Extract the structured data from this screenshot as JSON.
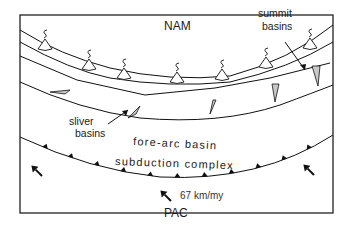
{
  "diagram": {
    "labels": {
      "upper_plate": "NAM",
      "summit_basins_line1": "summit",
      "summit_basins_line2": "basins",
      "sliver_basins_line1": "sliver",
      "sliver_basins_line2": "basins",
      "fore_arc_basin": "fore-arc basin",
      "subduction_complex": "subduction complex",
      "velocity": "67 km/my",
      "lower_plate": "PAC"
    },
    "volcano_count": 8,
    "colors": {
      "line": "#111111",
      "basin_fill": "#c8c8c8",
      "background": "#ffffff"
    }
  }
}
